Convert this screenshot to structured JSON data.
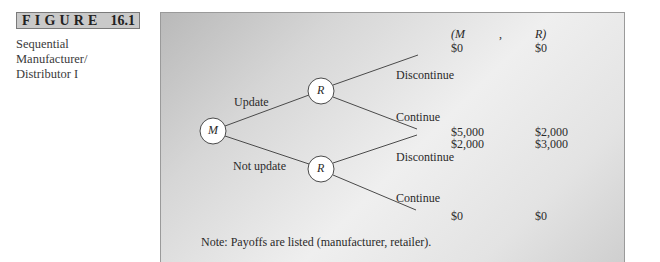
{
  "figure": {
    "label_word": "FIGURE",
    "label_number": "16.1",
    "caption_lines": [
      "Sequential",
      "Manufacturer/",
      "Distributor I"
    ]
  },
  "tree": {
    "root_node": "M",
    "upper_node": "R",
    "lower_node": "R",
    "branches": {
      "update": "Update",
      "not_update": "Not update",
      "upper_discontinue": "Discontinue",
      "upper_continue": "Continue",
      "lower_discontinue": "Discontinue",
      "lower_continue": "Continue"
    }
  },
  "payoffs": {
    "header_left": "(M",
    "header_comma": ",",
    "header_right": "R)",
    "rows": [
      {
        "m": "$0",
        "r": "$0"
      },
      {
        "m": "$5,000",
        "r": "$2,000"
      },
      {
        "m": "$2,000",
        "r": "$3,000"
      },
      {
        "m": "$0",
        "r": "$0"
      }
    ]
  },
  "note": "Note: Payoffs are listed (manufacturer, retailer).",
  "colors": {
    "line": "#4a4a4a",
    "node_fill": "#ffffff",
    "panel_border": "#9a9a9a",
    "label_bg": "#c9c9c9"
  }
}
